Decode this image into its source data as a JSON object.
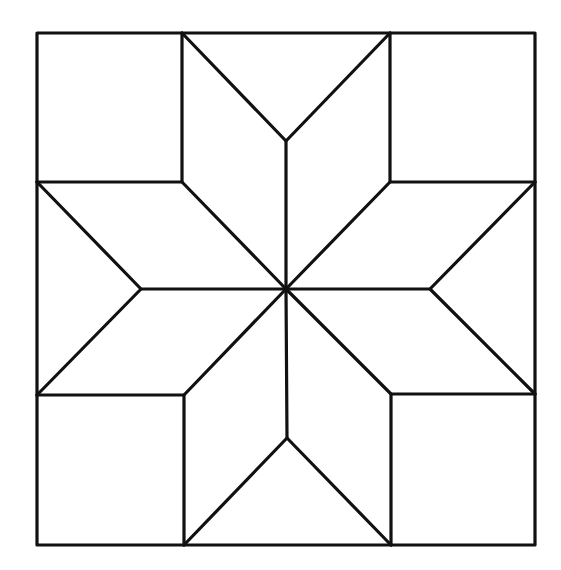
{
  "diagram": {
    "type": "eight-point-star-quilt-block",
    "stroke_color": "#111111",
    "background_color": "#ffffff",
    "outer_square": {
      "x1": 37,
      "y1": 33,
      "x2": 535,
      "y2": 545
    },
    "center": {
      "x": 286,
      "y": 289
    },
    "inner_corners": {
      "top_left": {
        "x": 182,
        "y": 182
      },
      "top_right": {
        "x": 390,
        "y": 182
      },
      "bottom_left": {
        "x": 184,
        "y": 395
      },
      "bottom_right": {
        "x": 391,
        "y": 394
      }
    },
    "notches": {
      "top": {
        "x": 286,
        "y": 141
      },
      "bottom": {
        "x": 287,
        "y": 438
      },
      "left": {
        "x": 141,
        "y": 289
      },
      "right": {
        "x": 430,
        "y": 289
      }
    },
    "shapes": {
      "corner_squares": 4,
      "diamonds": 8,
      "side_triangles": 4
    }
  }
}
